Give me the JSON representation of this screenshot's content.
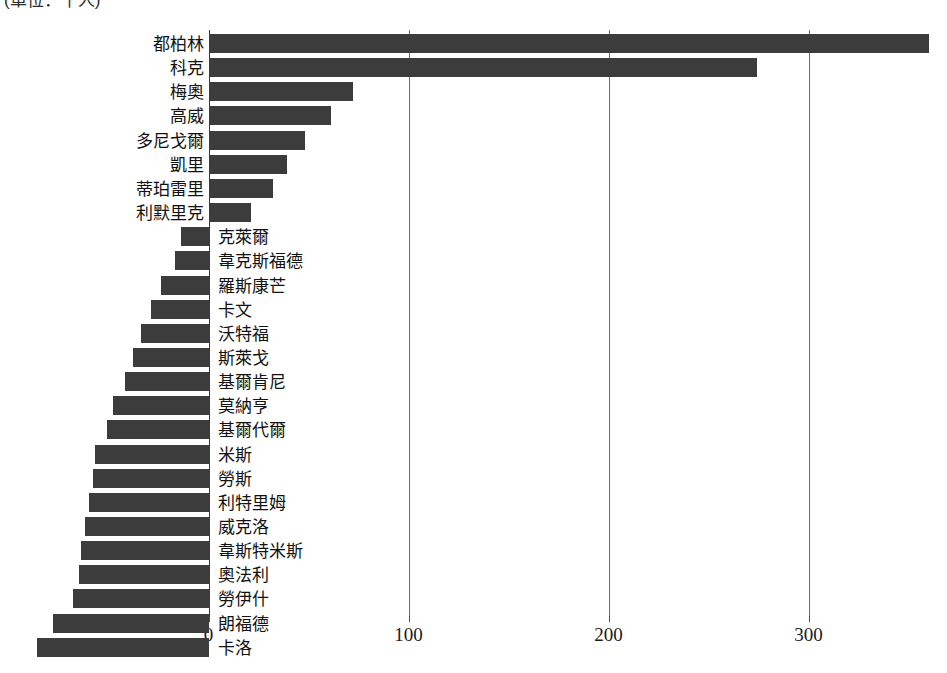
{
  "caption": {
    "unit_note": "(單位：千人)"
  },
  "chart_data": {
    "type": "bar",
    "orientation": "horizontal",
    "title": "",
    "subtitle": "(單位：千人)",
    "xlabel": "",
    "ylabel": "",
    "xlim": [
      -90,
      365
    ],
    "xticks": [
      0,
      100,
      200,
      300
    ],
    "xtick_labels": [
      "0",
      "100",
      "200",
      "300"
    ],
    "grid": true,
    "legend": false,
    "bar_color": "#3c3c3c",
    "categories": [
      "都柏林",
      "科克",
      "梅奧",
      "高威",
      "多尼戈爾",
      "凱里",
      "蒂珀雷里",
      "利默里克",
      "克萊爾",
      "韋克斯福德",
      "羅斯康芒",
      "卡文",
      "沃特福",
      "斯萊戈",
      "基爾肯尼",
      "莫納亨",
      "基爾代爾",
      "米斯",
      "勞斯",
      "利特里姆",
      "威克洛",
      "韋斯特米斯",
      "奧法利",
      "勞伊什",
      "朗福德",
      "卡洛"
    ],
    "values": [
      360,
      274,
      72,
      61,
      48,
      39,
      32,
      21,
      -14,
      -17,
      -24,
      -29,
      -34,
      -38,
      -42,
      -48,
      -51,
      -57,
      -58,
      -60,
      -62,
      -64,
      -65,
      -68,
      -78,
      -86
    ]
  }
}
